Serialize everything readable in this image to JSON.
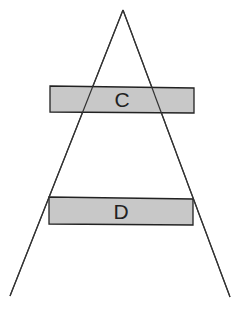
{
  "diagram": {
    "type": "triangle-with-bars",
    "colors": {
      "line": "#333333",
      "bar_fill": "#c8c8c8",
      "bar_stroke": "#222222",
      "background": "#ffffff"
    },
    "bars": [
      {
        "label": "C"
      },
      {
        "label": "D"
      }
    ]
  }
}
